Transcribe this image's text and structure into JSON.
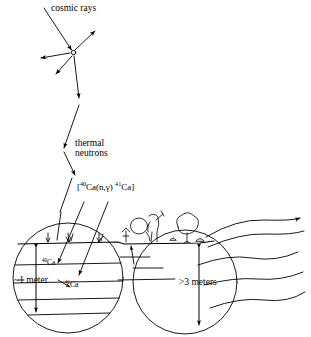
{
  "diagram": {
    "background_color": "#ffffff",
    "ink_color": "#000000",
    "labels": {
      "cosmic_rays": "cosmic rays",
      "thermal_line1": "thermal",
      "thermal_line2": "neutrons",
      "reaction_open": "[",
      "reaction_mass_40": "40",
      "reaction_target": "Ca",
      "reaction_channel": "(n,γ)",
      "reaction_mass_41": "41",
      "reaction_product": "Ca",
      "reaction_close": "]",
      "isotope_parent_mass": "40",
      "isotope_parent_symbol": "Ca",
      "isotope_daughter_mass": "41",
      "isotope_daughter_symbol": "Ca",
      "depth_shallow": "~1 meter",
      "depth_deep": ">3 meters"
    },
    "scene": {
      "shallow_zone_label": "~1 meter",
      "deep_zone_label": ">3 meters",
      "surface_flux_marks": 3,
      "soil_strata_lines": 4,
      "groundwater_flow_lines": 5,
      "magnifier_circles": 2,
      "cascade_secondary_rays": 4
    }
  }
}
